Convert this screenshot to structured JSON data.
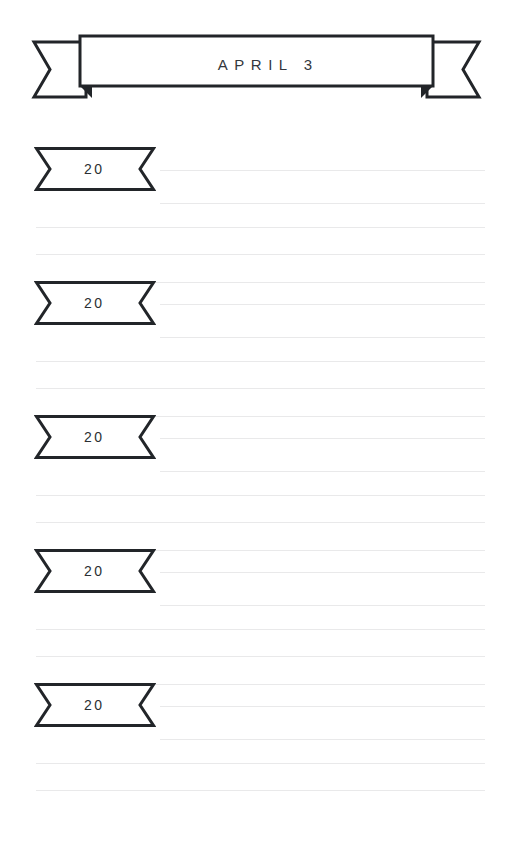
{
  "page": {
    "width": 513,
    "height": 855,
    "background_color": "#ffffff",
    "rule_color": "#e9e9ea",
    "ink_color": "#222529"
  },
  "header": {
    "title": "APRIL 3",
    "banner_shape": "ribbon-banner",
    "left_tail_name": "ribbon-tail-left",
    "right_tail_name": "ribbon-tail-right"
  },
  "sections": [
    {
      "year_label": "20",
      "tag_top": 146,
      "rules": [
        {
          "y": 170,
          "style": "short"
        },
        {
          "y": 203,
          "style": "short"
        },
        {
          "y": 227,
          "style": "full"
        },
        {
          "y": 254,
          "style": "full"
        },
        {
          "y": 282,
          "style": "full"
        }
      ]
    },
    {
      "year_label": "20",
      "tag_top": 280,
      "rules": [
        {
          "y": 304,
          "style": "short"
        },
        {
          "y": 337,
          "style": "short"
        },
        {
          "y": 361,
          "style": "full"
        },
        {
          "y": 388,
          "style": "full"
        },
        {
          "y": 416,
          "style": "full"
        }
      ]
    },
    {
      "year_label": "20",
      "tag_top": 414,
      "rules": [
        {
          "y": 438,
          "style": "short"
        },
        {
          "y": 471,
          "style": "short"
        },
        {
          "y": 495,
          "style": "full"
        },
        {
          "y": 522,
          "style": "full"
        },
        {
          "y": 550,
          "style": "full"
        }
      ]
    },
    {
      "year_label": "20",
      "tag_top": 548,
      "rules": [
        {
          "y": 572,
          "style": "short"
        },
        {
          "y": 605,
          "style": "short"
        },
        {
          "y": 629,
          "style": "full"
        },
        {
          "y": 656,
          "style": "full"
        },
        {
          "y": 684,
          "style": "full"
        }
      ]
    },
    {
      "year_label": "20",
      "tag_top": 682,
      "rules": [
        {
          "y": 706,
          "style": "short"
        },
        {
          "y": 739,
          "style": "short"
        },
        {
          "y": 763,
          "style": "full"
        },
        {
          "y": 790,
          "style": "full"
        }
      ]
    }
  ]
}
